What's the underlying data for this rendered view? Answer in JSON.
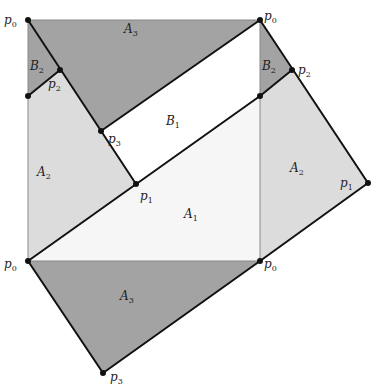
{
  "diagram": {
    "colors": {
      "dark": "#a3a3a3",
      "light": "#dcdcdc",
      "faint": "#f6f6f6",
      "white": "#ffffff",
      "line": "#111111",
      "thin": "#888888"
    },
    "regions": [
      {
        "name": "A3",
        "base": "A",
        "sub": "3",
        "label_pos": [
          124,
          33
        ]
      },
      {
        "name": "B2",
        "base": "B",
        "sub": "2",
        "label_pos": [
          30,
          70
        ]
      },
      {
        "name": "B1",
        "base": "B",
        "sub": "1",
        "label_pos": [
          166,
          125
        ]
      },
      {
        "name": "A2",
        "base": "A",
        "sub": "2",
        "label_pos": [
          37,
          176
        ]
      },
      {
        "name": "A1",
        "base": "A",
        "sub": "1",
        "label_pos": [
          184,
          218
        ]
      },
      {
        "name": "B2",
        "base": "B",
        "sub": "2",
        "label_pos": [
          262,
          70
        ]
      },
      {
        "name": "A2",
        "base": "A",
        "sub": "2",
        "label_pos": [
          290,
          172
        ]
      },
      {
        "name": "A3",
        "base": "A",
        "sub": "3",
        "label_pos": [
          120,
          300
        ]
      }
    ],
    "points": [
      {
        "name": "p0",
        "base": "p",
        "sub": "0",
        "label_pos": [
          4,
          24
        ]
      },
      {
        "name": "p0",
        "base": "p",
        "sub": "0",
        "label_pos": [
          264,
          20
        ]
      },
      {
        "name": "p2",
        "base": "p",
        "sub": "2",
        "label_pos": [
          48,
          88
        ]
      },
      {
        "name": "p2",
        "base": "p",
        "sub": "2",
        "label_pos": [
          298,
          74
        ]
      },
      {
        "name": "p3",
        "base": "p",
        "sub": "3",
        "label_pos": [
          108,
          143
        ]
      },
      {
        "name": "p1",
        "base": "p",
        "sub": "1",
        "label_pos": [
          140,
          200
        ]
      },
      {
        "name": "p1",
        "base": "p",
        "sub": "1",
        "label_pos": [
          340,
          187
        ]
      },
      {
        "name": "p0",
        "base": "p",
        "sub": "0",
        "label_pos": [
          4,
          268
        ]
      },
      {
        "name": "p0",
        "base": "p",
        "sub": "0",
        "label_pos": [
          264,
          268
        ]
      },
      {
        "name": "p3",
        "base": "p",
        "sub": "3",
        "label_pos": [
          110,
          381
        ]
      }
    ]
  }
}
